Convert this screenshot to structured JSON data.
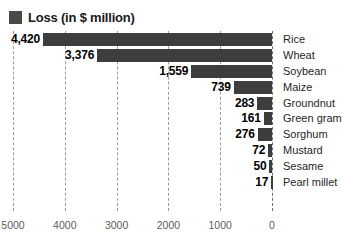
{
  "legend": {
    "label": "Loss (in $ million)",
    "swatch_color": "#4a4a4a",
    "swatch_icon": "square-swatch-icon"
  },
  "colors": {
    "bar": "#3d3d3d",
    "gridline": "#9a9a9a",
    "value_text": "#000000",
    "category_text": "#1f1f1f",
    "axis_text": "#5c5c5c",
    "background": "#ffffff"
  },
  "chart_data": {
    "type": "bar",
    "orientation": "horizontal",
    "title": "",
    "xlabel": "",
    "ylabel": "",
    "legend_position": "top-left",
    "grid": true,
    "xlim": [
      5000,
      0
    ],
    "x_axis_reversed": true,
    "xticks": [
      5000,
      4000,
      3000,
      2000,
      1000,
      0
    ],
    "xtick_labels": [
      "5000",
      "4000",
      "3000",
      "2000",
      "1000",
      "0"
    ],
    "categories": [
      "Rice",
      "Wheat",
      "Soybean",
      "Maize",
      "Groundnut",
      "Green gram",
      "Sorghum",
      "Mustard",
      "Sesame",
      "Pearl millet"
    ],
    "values": [
      4420,
      3376,
      1559,
      739,
      283,
      161,
      276,
      72,
      50,
      17
    ],
    "value_labels": [
      "4,420",
      "3,376",
      "1,559",
      "739",
      "283",
      "161",
      "276",
      "72",
      "50",
      "17"
    ],
    "series": [
      {
        "name": "Loss (in $ million)",
        "values": [
          4420,
          3376,
          1559,
          739,
          283,
          161,
          276,
          72,
          50,
          17
        ]
      }
    ]
  }
}
